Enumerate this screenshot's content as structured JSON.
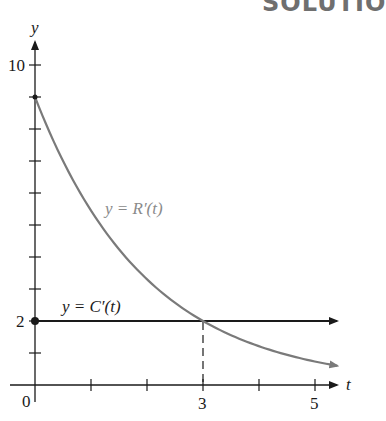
{
  "header": {
    "text": "SOLUTIO"
  },
  "chart_data": {
    "type": "line",
    "title": "",
    "xlabel": "t",
    "ylabel": "y",
    "xlim": [
      0,
      5.5
    ],
    "ylim": [
      0,
      10.8
    ],
    "x_ticks": [
      1,
      2,
      3,
      4,
      5
    ],
    "x_tick_labels": {
      "3": "3",
      "5": "5"
    },
    "y_ticks": [
      1,
      2,
      3,
      4,
      5,
      6,
      7,
      8,
      9,
      10
    ],
    "y_tick_labels": {
      "2": "2",
      "10": "10"
    },
    "origin_label": "0",
    "grid": false,
    "series": [
      {
        "name": "y = R'(t)",
        "color": "#7a7a7a",
        "form": "exponential decay",
        "x": [
          0,
          0.5,
          1,
          1.5,
          2,
          2.5,
          3,
          3.5,
          4,
          4.5,
          5,
          5.4
        ],
        "values": [
          9.0,
          7.0,
          5.46,
          4.25,
          3.3,
          2.57,
          2.0,
          1.56,
          1.21,
          0.94,
          0.74,
          0.6
        ]
      },
      {
        "name": "y = C'(t)",
        "color": "#1a1a1a",
        "form": "constant",
        "x": [
          0,
          5.5
        ],
        "values": [
          2,
          2
        ]
      }
    ],
    "annotations": [
      {
        "type": "intersection",
        "x": 3,
        "y": 2,
        "dashed_line_to_axis": true
      },
      {
        "type": "point",
        "x": 0,
        "y": 2
      },
      {
        "type": "point",
        "x": 0,
        "y": 9
      }
    ],
    "labels": {
      "r_curve": "y = R′(t)",
      "c_line": "y = C′(t)"
    }
  }
}
